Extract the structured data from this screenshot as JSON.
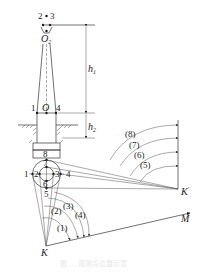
{
  "figure": {
    "points_top": {
      "p2": "2",
      "p3": "3",
      "o2": "O",
      "o2_sub": "2"
    },
    "heights": {
      "h1": "h",
      "h1_sub": "1",
      "h2": "h",
      "h2_sub": "2"
    },
    "base_points": {
      "p1": "1",
      "o": "O",
      "p4": "4"
    },
    "circle_points": {
      "p1": "1",
      "p2": "2",
      "p3": "3",
      "p4": "4",
      "p5": "5",
      "p6": "6",
      "p7": "7",
      "p8": "8"
    },
    "angles_k": [
      "(1)",
      "(2)",
      "(3)",
      "(4)"
    ],
    "angles_k_prime": [
      "(5)",
      "(6)",
      "(7)",
      "(8)"
    ],
    "stations": {
      "k": "K",
      "k_prime": "K",
      "k_prime_mark": "′",
      "m": "M"
    },
    "caption": "图 … 观测点位置示意"
  }
}
